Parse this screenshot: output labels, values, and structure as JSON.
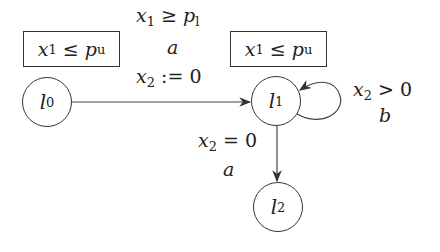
{
  "automaton": {
    "locations": [
      {
        "id": "l0",
        "name": "l",
        "sub": "0",
        "invariant": {
          "lhs": "x",
          "lhs_sub": "1",
          "op": "≤",
          "rhs": "p",
          "rhs_sub": "u"
        }
      },
      {
        "id": "l1",
        "name": "l",
        "sub": "1",
        "invariant": {
          "lhs": "x",
          "lhs_sub": "1",
          "op": "≤",
          "rhs": "p",
          "rhs_sub": "u"
        }
      },
      {
        "id": "l2",
        "name": "l",
        "sub": "2"
      }
    ],
    "edges": [
      {
        "from": "l0",
        "to": "l1",
        "guard": {
          "lhs": "x",
          "lhs_sub": "1",
          "op": "≥",
          "rhs": "p",
          "rhs_sub": "l"
        },
        "action": "a",
        "reset": {
          "lhs": "x",
          "lhs_sub": "2",
          "op": ":=",
          "rhs": "0"
        }
      },
      {
        "from": "l1",
        "to": "l1",
        "guard": {
          "lhs": "x",
          "lhs_sub": "2",
          "op": ">",
          "rhs": "0"
        },
        "action": "b"
      },
      {
        "from": "l1",
        "to": "l2",
        "guard": {
          "lhs": "x",
          "lhs_sub": "2",
          "op": "=",
          "rhs": "0"
        },
        "action": "a"
      }
    ]
  }
}
